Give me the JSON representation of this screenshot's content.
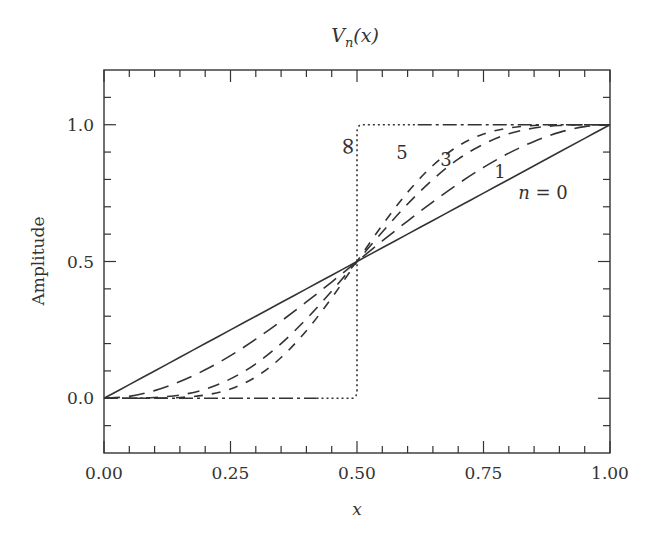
{
  "chart_data": {
    "type": "line",
    "title_main": "V",
    "title_sub": "n",
    "title_arg": "(x)",
    "xlabel": "x",
    "ylabel": "Amplitude",
    "xlim": [
      0,
      1
    ],
    "ylim": [
      -0.2,
      1.2
    ],
    "grid": false,
    "legend": "inline curve labels",
    "x_ticks": [
      0.0,
      0.25,
      0.5,
      0.75,
      1.0
    ],
    "x_tick_labels": [
      "0.00",
      "0.25",
      "0.50",
      "0.75",
      "1.00"
    ],
    "x_minor_step": 0.05,
    "y_ticks": [
      0.0,
      0.5,
      1.0
    ],
    "y_tick_labels": [
      "0.0",
      "0.5",
      "1.0"
    ],
    "y_minor_step": 0.1,
    "x": [
      0,
      0.05,
      0.1,
      0.15,
      0.2,
      0.25,
      0.3,
      0.35,
      0.4,
      0.45,
      0.5,
      0.55,
      0.6,
      0.65,
      0.7,
      0.75,
      0.8,
      0.85,
      0.9,
      0.95,
      1.0
    ],
    "series": [
      {
        "name": "n = 0",
        "label": "n = 0",
        "style": "solid",
        "values": [
          0,
          0.05,
          0.1,
          0.15,
          0.2,
          0.25,
          0.3,
          0.35,
          0.4,
          0.45,
          0.5,
          0.55,
          0.6,
          0.65,
          0.7,
          0.75,
          0.8,
          0.85,
          0.9,
          0.95,
          1.0
        ]
      },
      {
        "name": "n = 1",
        "label": "1",
        "style": "long-dash",
        "values": [
          0,
          0.007,
          0.028,
          0.061,
          0.104,
          0.156,
          0.216,
          0.282,
          0.352,
          0.425,
          0.5,
          0.575,
          0.648,
          0.718,
          0.784,
          0.844,
          0.896,
          0.939,
          0.972,
          0.993,
          1.0
        ]
      },
      {
        "name": "n = 3",
        "label": "3",
        "style": "medium-dash",
        "values": [
          0,
          0.0002,
          0.003,
          0.012,
          0.033,
          0.071,
          0.126,
          0.2,
          0.29,
          0.392,
          0.5,
          0.608,
          0.71,
          0.8,
          0.874,
          0.929,
          0.967,
          0.988,
          0.997,
          0.9998,
          1.0
        ]
      },
      {
        "name": "n = 5",
        "label": "5",
        "style": "short-dash",
        "values": [
          0,
          0.0,
          0.0003,
          0.003,
          0.012,
          0.034,
          0.078,
          0.149,
          0.247,
          0.367,
          0.5,
          0.633,
          0.753,
          0.851,
          0.922,
          0.966,
          0.988,
          0.997,
          0.9997,
          1.0,
          1.0
        ]
      },
      {
        "name": "n = ∞",
        "label": "∞",
        "style": "dotted step (dash-dot on flat segments)",
        "values": [
          0,
          0,
          0,
          0,
          0,
          0,
          0,
          0,
          0,
          0,
          0.5,
          1,
          1,
          1,
          1,
          1,
          1,
          1,
          1,
          1,
          1
        ]
      }
    ],
    "annotations": [
      {
        "text": "∞",
        "x": 0.47,
        "y": 1.03,
        "rotated": true
      },
      {
        "text": "5",
        "x": 0.59,
        "y": 0.98
      },
      {
        "text": "3",
        "x": 0.675,
        "y": 0.95
      },
      {
        "text": "1",
        "x": 0.785,
        "y": 0.9
      },
      {
        "text": "n = 0",
        "x": 0.82,
        "y": 0.82
      }
    ]
  }
}
